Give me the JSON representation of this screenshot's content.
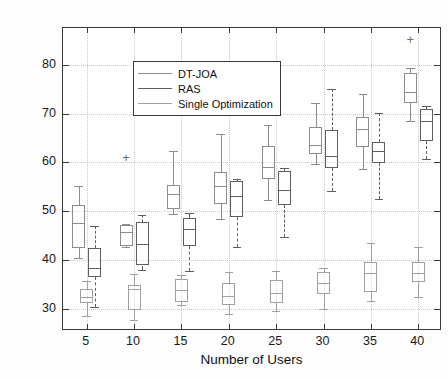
{
  "chart_data": {
    "type": "box",
    "title": "",
    "xlabel": "Number of Users",
    "ylabel": "Delay of Emergency User(ms)",
    "xlim": [
      2.5,
      42.5
    ],
    "ylim": [
      25.5,
      87.5
    ],
    "xticks": [
      5,
      10,
      15,
      20,
      25,
      30,
      35,
      40
    ],
    "yticks": [
      30,
      40,
      50,
      60,
      70,
      80
    ],
    "grid": true,
    "legend_position": "top-left",
    "categories": [
      5,
      10,
      15,
      20,
      25,
      30,
      35,
      40
    ],
    "series": [
      {
        "name": "DT-JOA",
        "color": "#8c8c8c",
        "line_style": "solid",
        "offset": -0.85,
        "boxes": [
          {
            "x": 5,
            "whisker_low": 40.5,
            "q1": 42.5,
            "median": 47.6,
            "q3": 51.3,
            "whisker_high": 55.2,
            "outliers": []
          },
          {
            "x": 10,
            "whisker_low": 42.6,
            "q1": 42.8,
            "median": 45.8,
            "q3": 47.1,
            "whisker_high": 47.3,
            "outliers": [
              61.2
            ]
          },
          {
            "x": 15,
            "whisker_low": 49.5,
            "q1": 50.4,
            "median": 53.5,
            "q3": 55.3,
            "whisker_high": 62.4,
            "outliers": []
          },
          {
            "x": 20,
            "whisker_low": 48.4,
            "q1": 51.5,
            "median": 55.1,
            "q3": 58.1,
            "whisker_high": 65.9,
            "outliers": []
          },
          {
            "x": 25,
            "whisker_low": 52.4,
            "q1": 56.6,
            "median": 59.1,
            "q3": 63.3,
            "whisker_high": 67.7,
            "outliers": []
          },
          {
            "x": 30,
            "whisker_low": 59.6,
            "q1": 61.8,
            "median": 63.6,
            "q3": 67.2,
            "whisker_high": 72.2,
            "outliers": []
          },
          {
            "x": 35,
            "whisker_low": 58.7,
            "q1": 63.1,
            "median": 66.8,
            "q3": 69.3,
            "whisker_high": 73.9,
            "outliers": []
          },
          {
            "x": 40,
            "whisker_low": 68.5,
            "q1": 72.2,
            "median": 74.4,
            "q3": 78.3,
            "whisker_high": 79.4,
            "outliers": [
              85.2
            ]
          }
        ]
      },
      {
        "name": "RAS",
        "color": "#5e5e5e",
        "line_style": "dashed",
        "offset": 0.85,
        "boxes": [
          {
            "x": 5,
            "whisker_low": 30.4,
            "q1": 36.6,
            "median": 38.4,
            "q3": 42.5,
            "whisker_high": 46.9,
            "outliers": []
          },
          {
            "x": 10,
            "whisker_low": 37.9,
            "q1": 38.9,
            "median": 43.3,
            "q3": 47.9,
            "whisker_high": 49.3,
            "outliers": []
          },
          {
            "x": 15,
            "whisker_low": 37.7,
            "q1": 42.8,
            "median": 46.4,
            "q3": 48.6,
            "whisker_high": 49.6,
            "outliers": []
          },
          {
            "x": 20,
            "whisker_low": 42.6,
            "q1": 48.8,
            "median": 53.1,
            "q3": 56.1,
            "whisker_high": 56.6,
            "outliers": []
          },
          {
            "x": 25,
            "whisker_low": 44.8,
            "q1": 51.2,
            "median": 54.4,
            "q3": 58.3,
            "whisker_high": 58.8,
            "outliers": []
          },
          {
            "x": 30,
            "whisker_low": 54.2,
            "q1": 58.8,
            "median": 61.3,
            "q3": 66.6,
            "whisker_high": 75.1,
            "outliers": []
          },
          {
            "x": 35,
            "whisker_low": 52.5,
            "q1": 59.8,
            "median": 62.3,
            "q3": 64.2,
            "whisker_high": 70.2,
            "outliers": []
          },
          {
            "x": 40,
            "whisker_low": 60.6,
            "q1": 64.3,
            "median": 68.4,
            "q3": 71.0,
            "whisker_high": 71.5,
            "outliers": []
          }
        ]
      },
      {
        "name": "Single Optimization",
        "color": "#a0a0a0",
        "line_style": "dotted",
        "offset": 0.0,
        "boxes": [
          {
            "x": 5,
            "whisker_low": 28.5,
            "q1": 31.2,
            "median": 32.5,
            "q3": 34.1,
            "whisker_high": 35.7,
            "outliers": []
          },
          {
            "x": 10,
            "whisker_low": 27.7,
            "q1": 29.8,
            "median": 34.0,
            "q3": 35.0,
            "whisker_high": 37.2,
            "outliers": []
          },
          {
            "x": 15,
            "whisker_low": 30.8,
            "q1": 31.5,
            "median": 33.8,
            "q3": 36.2,
            "whisker_high": 37.0,
            "outliers": []
          },
          {
            "x": 20,
            "whisker_low": 28.9,
            "q1": 30.9,
            "median": 32.6,
            "q3": 35.4,
            "whisker_high": 37.5,
            "outliers": []
          },
          {
            "x": 25,
            "whisker_low": 29.6,
            "q1": 31.3,
            "median": 33.3,
            "q3": 36.0,
            "whisker_high": 37.7,
            "outliers": []
          },
          {
            "x": 30,
            "whisker_low": 29.9,
            "q1": 33.0,
            "median": 35.3,
            "q3": 37.5,
            "whisker_high": 38.3,
            "outliers": []
          },
          {
            "x": 35,
            "whisker_low": 31.6,
            "q1": 33.5,
            "median": 37.4,
            "q3": 39.6,
            "whisker_high": 43.6,
            "outliers": []
          },
          {
            "x": 40,
            "whisker_low": 32.5,
            "q1": 35.5,
            "median": 37.4,
            "q3": 39.7,
            "whisker_high": 42.6,
            "outliers": []
          }
        ]
      }
    ]
  },
  "legend": {
    "items": [
      {
        "label": "DT-JOA"
      },
      {
        "label": "RAS"
      },
      {
        "label": "Single Optimization"
      }
    ]
  }
}
